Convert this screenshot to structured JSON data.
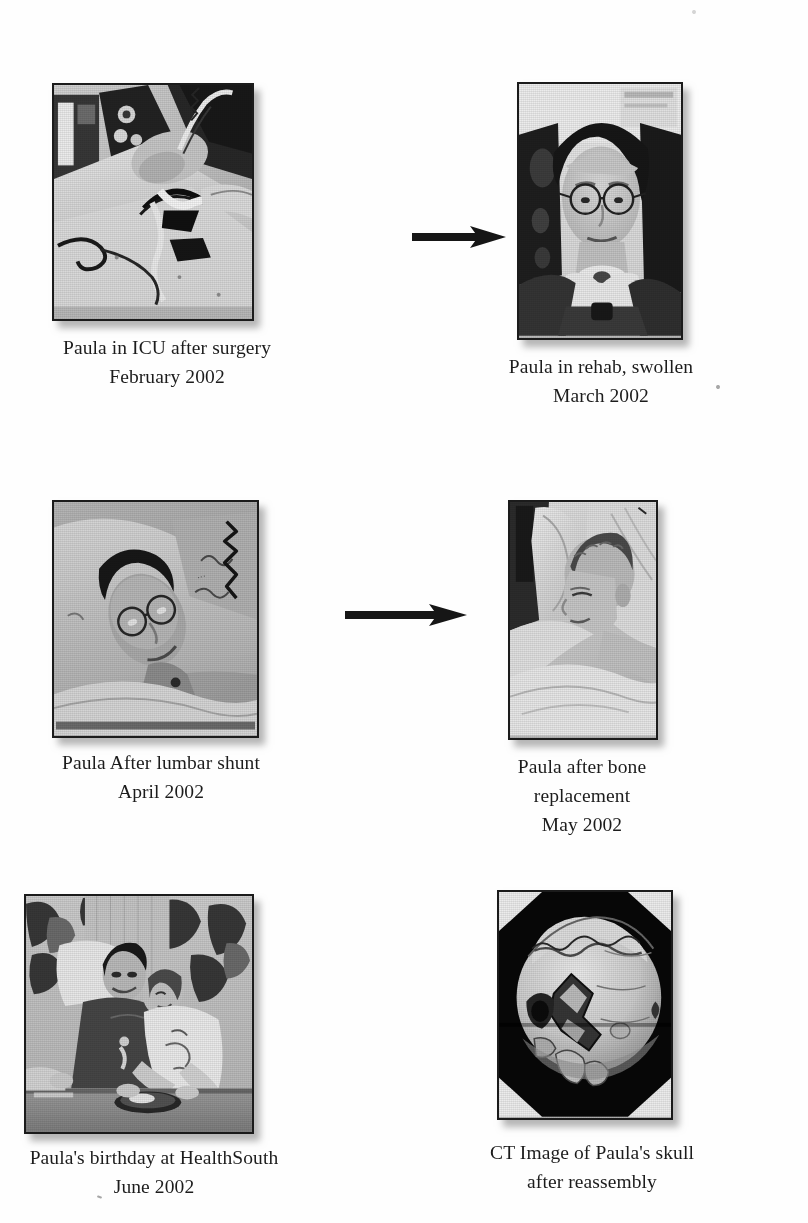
{
  "document": {
    "kind": "photo-timeline-page",
    "background_color": "#fefefe",
    "text_color": "#1c1c1c"
  },
  "figures": [
    {
      "id": "icu",
      "photo_name": "photo-paula-icu",
      "alt": "Black and white photo of Paula lying in an ICU bed after surgery, surrounded by tubes, wires and monitoring equipment",
      "caption_lines": [
        "Paula in ICU after surgery",
        "February 2002"
      ],
      "frame": {
        "x": 52,
        "y": 83,
        "w": 202,
        "h": 238
      }
    },
    {
      "id": "rehab",
      "photo_name": "photo-paula-rehab",
      "alt": "Black and white portrait of Paula seated in rehab wearing glasses, face swollen, tracheostomy collar visible",
      "caption_lines": [
        "Paula in rehab, swollen",
        "March 2002"
      ],
      "frame": {
        "x": 517,
        "y": 82,
        "w": 166,
        "h": 258
      }
    },
    {
      "id": "lumbar",
      "photo_name": "photo-paula-lumbar-shunt",
      "alt": "Black and white photo of Paula reclining in a hospital bed on a pillow after a lumbar shunt, wearing glasses",
      "caption_lines": [
        "Paula After lumbar shunt",
        "April 2002"
      ],
      "frame": {
        "x": 52,
        "y": 500,
        "w": 207,
        "h": 238
      }
    },
    {
      "id": "bone",
      "photo_name": "photo-paula-bone-replacement",
      "alt": "Black and white photo of Paula asleep in a hospital bed with short hair after bone flap replacement",
      "caption_lines": [
        "Paula after bone",
        "replacement",
        "May 2002"
      ],
      "frame": {
        "x": 508,
        "y": 500,
        "w": 150,
        "h": 240
      }
    },
    {
      "id": "birthday",
      "photo_name": "photo-paula-birthday",
      "alt": "Black and white photo of Paula's birthday at HealthSouth, two people reclining side by side at a table with a plate",
      "caption_lines": [
        "Paula's birthday at HealthSouth",
        "June 2002"
      ],
      "frame": {
        "x": 24,
        "y": 894,
        "w": 230,
        "h": 240
      }
    },
    {
      "id": "ct",
      "photo_name": "photo-ct-skull",
      "alt": "CT three dimensional reconstruction image of Paula's skull after reassembly, showing fracture lines",
      "caption_lines": [
        "CT Image of Paula's skull",
        "after reassembly"
      ],
      "frame": {
        "x": 497,
        "y": 890,
        "w": 176,
        "h": 230
      }
    }
  ],
  "arrows": [
    {
      "name": "arrow-icu-to-rehab",
      "x": 412,
      "y": 230,
      "length": 90,
      "direction": "right"
    },
    {
      "name": "arrow-lumbar-to-bone",
      "x": 345,
      "y": 608,
      "length": 118,
      "direction": "right"
    }
  ],
  "artifacts": [
    {
      "name": "scan-speck-left",
      "x": 97,
      "y": 1196
    },
    {
      "name": "scan-speck-right",
      "x": 716,
      "y": 385
    },
    {
      "name": "scan-speck-upper-right",
      "x": 692,
      "y": 10
    }
  ]
}
